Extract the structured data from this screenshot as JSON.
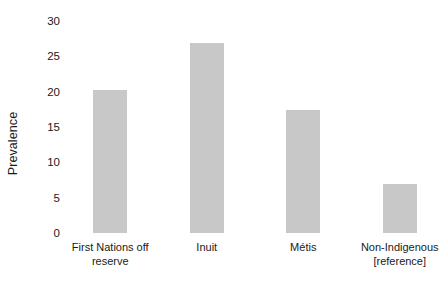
{
  "chart_data": {
    "type": "bar",
    "title": "",
    "subtitle": "",
    "xlabel": "",
    "ylabel": "Prevalence",
    "ylim": [
      0,
      30
    ],
    "grid": false,
    "legend": "none",
    "orientation": "vertical",
    "bar_color": "#c8c8c8",
    "categories": [
      "First Nations off\nreserve",
      "Inuit",
      "Métis",
      "Non-Indigenous\n[reference]"
    ],
    "values": [
      20.2,
      26.9,
      17.4,
      7.0
    ],
    "yticks": [
      0,
      5,
      10,
      15,
      20,
      25,
      30
    ],
    "ytick_labels": [
      "0",
      "5",
      "10",
      "15",
      "20",
      "25",
      "30"
    ]
  },
  "axis": {
    "y_title": "Prevalence"
  }
}
